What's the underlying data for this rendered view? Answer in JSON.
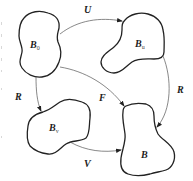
{
  "diagram": {
    "type": "commutative-mapping-diagram",
    "colors": {
      "stroke": "#222222",
      "arrow": "#555555",
      "background": "#ffffff"
    },
    "nodes": [
      {
        "id": "B0",
        "base": "B",
        "sub": "0"
      },
      {
        "id": "Bu",
        "base": "B",
        "sub": "u"
      },
      {
        "id": "Bv",
        "base": "B",
        "sub": "v"
      },
      {
        "id": "B",
        "base": "B",
        "sub": ""
      }
    ],
    "edges": [
      {
        "id": "U",
        "label": "U",
        "from": "B0",
        "to": "Bu"
      },
      {
        "id": "R_left",
        "label": "R",
        "from": "B0",
        "to": "Bv"
      },
      {
        "id": "F",
        "label": "F",
        "from": "B0",
        "to": "B"
      },
      {
        "id": "R_right",
        "label": "R",
        "from": "Bu",
        "to": "B"
      },
      {
        "id": "V",
        "label": "V",
        "from": "Bv",
        "to": "B"
      }
    ]
  }
}
